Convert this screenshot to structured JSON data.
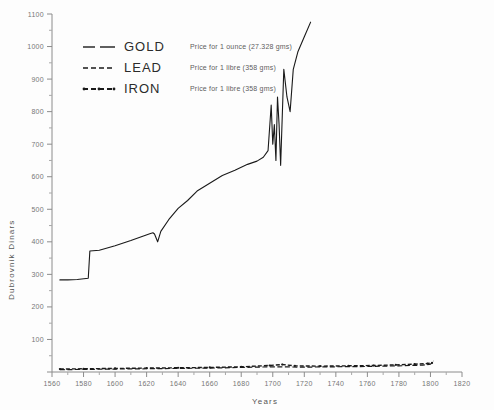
{
  "chart_data": {
    "type": "line",
    "title": "",
    "xlabel": "Years",
    "ylabel": "Dubrovnik  Dinars",
    "xlim": [
      1560,
      1820
    ],
    "ylim": [
      0,
      1100
    ],
    "xticks": [
      1560,
      1580,
      1600,
      1620,
      1640,
      1660,
      1680,
      1700,
      1720,
      1740,
      1760,
      1780,
      1800,
      1820
    ],
    "yticks": [
      0,
      100,
      200,
      300,
      400,
      500,
      600,
      700,
      800,
      900,
      1000,
      1100
    ],
    "xminor_step": 10,
    "yminor_step": 50,
    "grid": false,
    "legend_position": "upper-left-inside",
    "series": [
      {
        "name": "GOLD",
        "description": "Price for 1 ounce (27.328 gms)",
        "style": "long-dash",
        "points": [
          [
            1565,
            283
          ],
          [
            1570,
            283
          ],
          [
            1576,
            284
          ],
          [
            1583,
            288
          ],
          [
            1584,
            372
          ],
          [
            1590,
            374
          ],
          [
            1600,
            388
          ],
          [
            1610,
            404
          ],
          [
            1618,
            418
          ],
          [
            1622,
            425
          ],
          [
            1624,
            428
          ],
          [
            1625,
            424
          ],
          [
            1627,
            400
          ],
          [
            1629,
            432
          ],
          [
            1634,
            468
          ],
          [
            1640,
            503
          ],
          [
            1646,
            527
          ],
          [
            1652,
            556
          ],
          [
            1660,
            580
          ],
          [
            1668,
            604
          ],
          [
            1676,
            620
          ],
          [
            1684,
            638
          ],
          [
            1690,
            648
          ],
          [
            1694,
            660
          ],
          [
            1697,
            680
          ],
          [
            1699,
            820
          ],
          [
            1700,
            700
          ],
          [
            1701,
            760
          ],
          [
            1702,
            650
          ],
          [
            1703,
            845
          ],
          [
            1704,
            760
          ],
          [
            1705,
            635
          ],
          [
            1707,
            930
          ],
          [
            1709,
            845
          ],
          [
            1711,
            800
          ],
          [
            1713,
            930
          ],
          [
            1716,
            985
          ],
          [
            1720,
            1030
          ],
          [
            1724,
            1075
          ]
        ]
      },
      {
        "name": "LEAD",
        "description": "Price for 1 libre  (358 gms)",
        "style": "fine-dash",
        "points": [
          [
            1565,
            7
          ],
          [
            1580,
            8
          ],
          [
            1600,
            9
          ],
          [
            1620,
            10
          ],
          [
            1640,
            11
          ],
          [
            1660,
            12
          ],
          [
            1680,
            14
          ],
          [
            1700,
            16
          ],
          [
            1720,
            15
          ],
          [
            1740,
            16
          ],
          [
            1760,
            17
          ],
          [
            1780,
            19
          ],
          [
            1795,
            21
          ],
          [
            1800,
            24
          ],
          [
            1802,
            34
          ]
        ]
      },
      {
        "name": "IRON",
        "description": "Price for 1 libre  (358 gms)",
        "style": "dash-dot-marker",
        "points": [
          [
            1565,
            9
          ],
          [
            1580,
            10
          ],
          [
            1600,
            11
          ],
          [
            1620,
            12
          ],
          [
            1640,
            13
          ],
          [
            1660,
            14
          ],
          [
            1680,
            16
          ],
          [
            1698,
            20
          ],
          [
            1706,
            23
          ],
          [
            1714,
            19
          ],
          [
            1730,
            18
          ],
          [
            1748,
            19
          ],
          [
            1764,
            20
          ],
          [
            1778,
            22
          ],
          [
            1790,
            24
          ],
          [
            1798,
            26
          ],
          [
            1801,
            28
          ]
        ]
      }
    ]
  },
  "legend": {
    "rows": [
      {
        "name": "GOLD",
        "desc": "Price for 1 ounce (27.328 gms)"
      },
      {
        "name": "LEAD",
        "desc": "Price for 1 libre  (358 gms)"
      },
      {
        "name": "IRON",
        "desc": "Price for 1 libre  (358 gms)"
      }
    ]
  },
  "axes": {
    "x_title": "Years",
    "y_title": "Dubrovnik  Dinars"
  }
}
